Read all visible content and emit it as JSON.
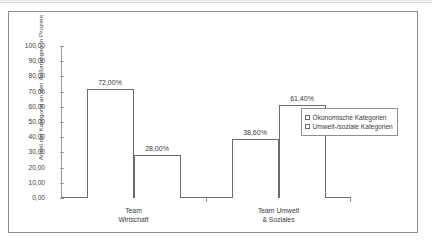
{
  "chart_data": {
    "type": "bar",
    "title": "",
    "subtitle": "",
    "xlabel": "",
    "ylabel": "Anteil der Kategorie an den Äußerungen in Prozent",
    "ylim": [
      0,
      100
    ],
    "grid": false,
    "legend_position": "right",
    "categories": [
      "Team Wirtschaft",
      "Team Umwelt & Soziales"
    ],
    "category_lines": [
      [
        "Team",
        "Wirtschaft"
      ],
      [
        "Team Umwelt",
        "& Soziales"
      ]
    ],
    "series": [
      {
        "name": "Ökonomische Kategorien",
        "values": [
          72.0,
          38.6
        ],
        "labels": [
          "72,00%",
          "38,60%"
        ],
        "color": "#ffffff",
        "border_color": "#6b6b6b"
      },
      {
        "name": "Umwelt-/soziale Kategorien",
        "values": [
          28.0,
          61.4
        ],
        "labels": [
          "28,00%",
          "61,40%"
        ],
        "color": "#ffffff",
        "border_color": "#6b6b6b"
      }
    ],
    "y_ticks": [
      0,
      10,
      20,
      30,
      40,
      50,
      60,
      70,
      80,
      90,
      100
    ],
    "y_tick_labels": [
      "0,00",
      "10,00",
      "20,00",
      "30,00",
      "40,00",
      "50,00",
      "60,00",
      "70,00",
      "80,00",
      "90,00",
      "100,00"
    ]
  },
  "legend": {
    "items": [
      {
        "label": "Ökonomische Kategorien"
      },
      {
        "label": "Umwelt-/soziale Kategorien"
      }
    ]
  },
  "colors": {
    "frame": "#8c8c8c",
    "axis": "#6e6e6e",
    "text": "#3a3a3a",
    "bar_fill": "#ffffff",
    "bar_stroke": "#6b6b6b"
  }
}
